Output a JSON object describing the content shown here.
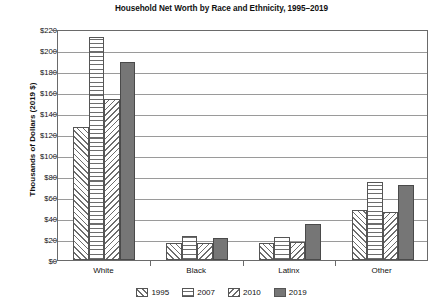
{
  "chart_data": {
    "type": "bar",
    "title": "Household Net Worth by Race and Ethnicity, 1995–2019",
    "xlabel": "",
    "ylabel": "Thousands of Dollars (2019 $)",
    "categories": [
      "White",
      "Black",
      "Latinx",
      "Other"
    ],
    "series": [
      {
        "name": "1995",
        "values": [
          127,
          16,
          16,
          48
        ],
        "pattern": "diagonal-up-hatch",
        "color": "#6d6d6d"
      },
      {
        "name": "2007",
        "values": [
          212,
          23,
          22,
          74
        ],
        "pattern": "horizontal-lines",
        "color": "#6d6d6d"
      },
      {
        "name": "2010",
        "values": [
          153,
          16,
          17,
          46
        ],
        "pattern": "diagonal-down-hatch",
        "color": "#6d6d6d"
      },
      {
        "name": "2019",
        "values": [
          189,
          21,
          34,
          71
        ],
        "pattern": "solid-gray",
        "color": "#767676"
      }
    ],
    "ylim": [
      0,
      220
    ],
    "ytick_step": 20,
    "ytick_labels": [
      "$0",
      "$20",
      "$40",
      "$60",
      "$80",
      "$100",
      "$120",
      "$140",
      "$160",
      "$180",
      "$200",
      "$220"
    ],
    "ytick_values": [
      0,
      20,
      40,
      60,
      80,
      100,
      120,
      140,
      160,
      180,
      200,
      220
    ],
    "grid": true,
    "legend_position": "bottom",
    "legend_entries": [
      "1995",
      "2007",
      "2010",
      "2019"
    ]
  }
}
